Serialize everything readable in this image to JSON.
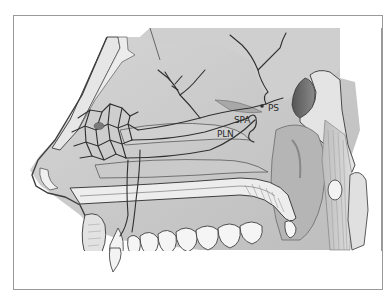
{
  "figure": {
    "labels": [
      {
        "id": "ps",
        "text": "PS",
        "x": 268,
        "y": 104
      },
      {
        "id": "spa",
        "text": "SPA",
        "x": 234,
        "y": 116
      },
      {
        "id": "pln",
        "text": "PLN",
        "x": 217,
        "y": 130
      }
    ],
    "colors": {
      "frame": "#9a9a9a",
      "tissue": "#c9c9c9",
      "tissue_light": "#dedede",
      "bone_light": "#e8e8e8",
      "vessel": "#2f2f2f",
      "dark_sinus": "#6e6e6e",
      "outline": "#4a4a4a"
    }
  }
}
